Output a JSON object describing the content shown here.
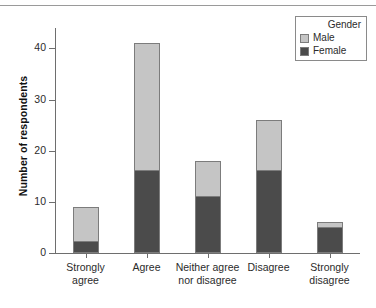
{
  "chart_data": {
    "type": "bar",
    "subtype": "stacked-vertical",
    "title": "",
    "xlabel": "",
    "ylabel": "Number of respondents",
    "ylim": [
      0,
      44
    ],
    "yticks": [
      0,
      10,
      20,
      30,
      40
    ],
    "ytick_labels": [
      "0",
      "10",
      "20",
      "30",
      "40"
    ],
    "grid": false,
    "categories": [
      "Strongly\nagree",
      "Agree",
      "Neither agree\nnor disagree",
      "Disagree",
      "Strongly\ndisagree"
    ],
    "series": [
      {
        "name": "Female",
        "color": "#4b4b4b",
        "values": [
          2,
          16,
          11,
          16,
          5
        ]
      },
      {
        "name": "Male",
        "color": "#c5c5c5",
        "values": [
          7,
          25,
          7,
          10,
          1
        ]
      }
    ],
    "totals": [
      9,
      41,
      18,
      26,
      6
    ],
    "legend": {
      "title": "Gender",
      "position": "top-right",
      "entries": [
        {
          "label": "Male",
          "color": "#c5c5c5"
        },
        {
          "label": "Female",
          "color": "#4b4b4b"
        }
      ]
    },
    "colors": {
      "male": "#c5c5c5",
      "female": "#4b4b4b",
      "axis": "#6e6e6e",
      "bar_outline": "#7c7c7c",
      "background": "#ffffff",
      "text": "#2b2b2b"
    }
  }
}
